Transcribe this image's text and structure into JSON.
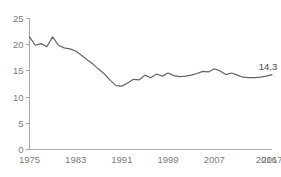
{
  "chart_data": {
    "type": "line",
    "title": "",
    "subtitle": "",
    "xlabel": "",
    "ylabel": "",
    "ylim": [
      0,
      25
    ],
    "xlim": [
      1975,
      2017
    ],
    "grid": false,
    "legend": false,
    "y_ticks": [
      0,
      5,
      10,
      15,
      20,
      25
    ],
    "y_tick_labels": [
      "0",
      "5",
      "10",
      "15",
      "20",
      "25"
    ],
    "x_ticks": [
      1975,
      1983,
      1991,
      1999,
      2007,
      2016,
      2017
    ],
    "x_tick_labels": [
      "1975",
      "1983",
      "1991",
      "1999",
      "2007",
      "2016",
      "2017"
    ],
    "annotations": [
      {
        "name": "end-value-label",
        "text": "14,3",
        "x": 2017,
        "y": 14.3
      }
    ],
    "series": [
      {
        "name": "rate",
        "color": "#636363",
        "x": [
          1975,
          1976,
          1977,
          1978,
          1979,
          1980,
          1981,
          1982,
          1983,
          1984,
          1985,
          1986,
          1987,
          1988,
          1989,
          1990,
          1991,
          1992,
          1993,
          1994,
          1995,
          1996,
          1997,
          1998,
          1999,
          2000,
          2001,
          2002,
          2003,
          2004,
          2005,
          2006,
          2007,
          2008,
          2009,
          2010,
          2011,
          2012,
          2013,
          2014,
          2015,
          2016,
          2017
        ],
        "values": [
          21.5,
          19.9,
          20.2,
          19.6,
          21.5,
          19.9,
          19.4,
          19.2,
          18.8,
          18.0,
          17.1,
          16.3,
          15.3,
          14.4,
          13.2,
          12.2,
          12.1,
          12.7,
          13.4,
          13.3,
          14.2,
          13.7,
          14.4,
          14.0,
          14.6,
          14.1,
          13.9,
          14.0,
          14.2,
          14.5,
          14.9,
          14.8,
          15.4,
          15.0,
          14.3,
          14.6,
          14.2,
          13.8,
          13.7,
          13.7,
          13.8,
          14.0,
          14.3
        ]
      }
    ]
  },
  "axis": {
    "y_axis_name": "y-axis",
    "x_axis_name": "x-axis"
  }
}
